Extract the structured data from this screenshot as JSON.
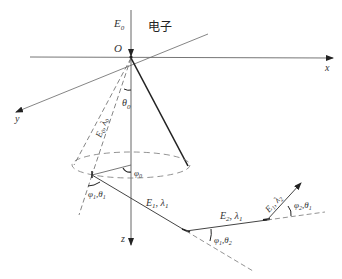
{
  "diagram": {
    "labels": {
      "E0": "E",
      "E0_sub": "0",
      "electron": "电子",
      "origin": "O",
      "x_axis": "x",
      "y_axis": "y",
      "z_axis": "z",
      "theta0": "θ",
      "theta0_sub": "0",
      "phi0": "φ",
      "phi0_sub": "0",
      "cone_edge": "E",
      "cone_edge_sub1": "0",
      "cone_edge_mid": ", λ",
      "cone_edge_sub2": "0",
      "angle1_a": "φ",
      "angle1_a_sub": "1",
      "angle1_b": ",θ",
      "angle1_b_sub": "1",
      "seg1_a": "E",
      "seg1_a_sub": "1",
      "seg1_b": ", λ",
      "seg1_b_sub": "1",
      "seg2_a": "E",
      "seg2_a_sub": "2",
      "seg2_b": ", λ",
      "seg2_b_sub": "1",
      "seg3_a": "E",
      "seg3_a_sub": "1",
      "seg3_b": ", λ",
      "seg3_b_sub": "2",
      "angle2_a": "φ",
      "angle2_a_sub": "1",
      "angle2_b": ",θ",
      "angle2_b_sub": "2",
      "angle3_a": "φ",
      "angle3_a_sub": "2",
      "angle3_b": ",θ",
      "angle3_b_sub": "1"
    },
    "colors": {
      "line": "#555555",
      "bold_line": "#222222",
      "dashed": "#777777"
    }
  }
}
